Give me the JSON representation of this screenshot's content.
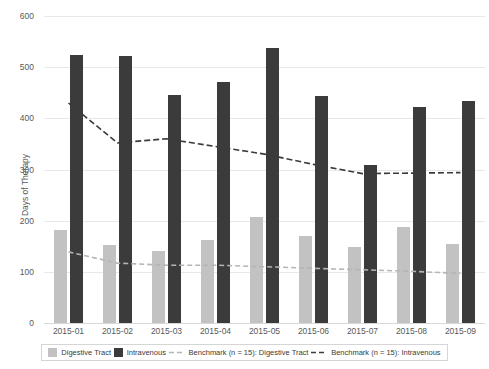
{
  "chart_data": {
    "type": "bar",
    "title": "",
    "xlabel": "",
    "ylabel": "Days of Therapy",
    "ylim": [
      0,
      600
    ],
    "yticks": [
      0,
      100,
      200,
      300,
      400,
      500,
      600
    ],
    "ytick_labels": [
      "0",
      "100",
      "200",
      "300",
      "400",
      "500",
      "600"
    ],
    "grid": true,
    "legend_position": "bottom",
    "categories": [
      "2015-01",
      "2015-02",
      "2015-03",
      "2015-04",
      "2015-05",
      "2015-06",
      "2015-07",
      "2015-08",
      "2015-09"
    ],
    "series": [
      {
        "name": "Digestive Tract",
        "type": "bar",
        "color": "#c2c2c2",
        "values": [
          181,
          153,
          141,
          163,
          208,
          171,
          149,
          187,
          155
        ]
      },
      {
        "name": "Intravenous",
        "type": "bar",
        "color": "#3b3b3b",
        "values": [
          524,
          522,
          446,
          471,
          538,
          444,
          309,
          423,
          433
        ]
      },
      {
        "name": "Benchmark (n = 15): Digestive Tract",
        "type": "line",
        "style": "dashed",
        "color": "#b5b5b5",
        "values": [
          139,
          117,
          113,
          113,
          110,
          107,
          104,
          101,
          97
        ]
      },
      {
        "name": "Benchmark (n = 15): Intravenous",
        "type": "line",
        "style": "dashed",
        "color": "#3b3b3b",
        "values": [
          430,
          352,
          360,
          345,
          330,
          310,
          292,
          293,
          294
        ]
      }
    ]
  },
  "legend": {
    "items": [
      {
        "label": "Digestive Tract",
        "marker": "swatch",
        "color": "#c2c2c2"
      },
      {
        "label": "Intravenous",
        "marker": "swatch",
        "color": "#3b3b3b"
      },
      {
        "label": "Benchmark (n = 15): Digestive Tract",
        "marker": "dashed-line",
        "color": "#b5b5b5"
      },
      {
        "label": "Benchmark (n = 15): Intravenous",
        "marker": "dashed-line",
        "color": "#3b3b3b"
      }
    ]
  }
}
